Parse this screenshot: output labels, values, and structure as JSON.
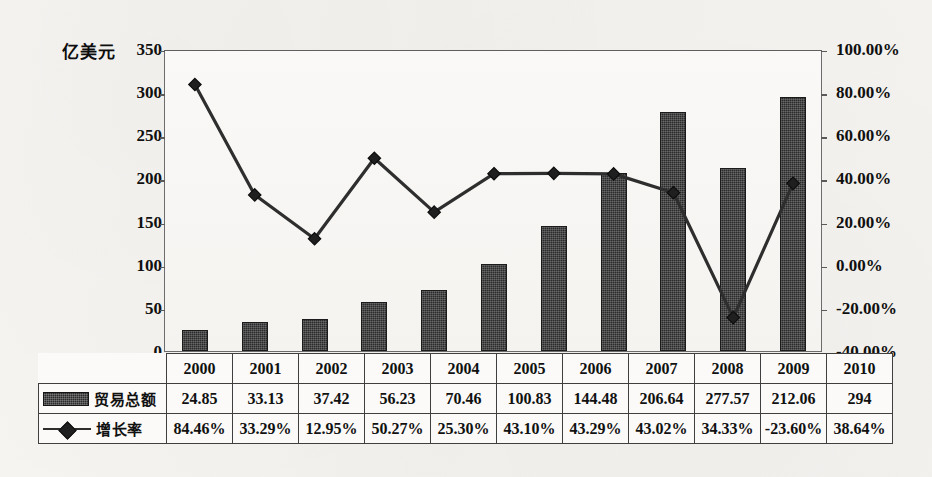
{
  "chart_data": {
    "type": "bar",
    "title": "",
    "subtitle": "",
    "xlabel": "",
    "ylabel": "亿美元",
    "y2label": "",
    "grid": false,
    "legend_position": "table-left",
    "categories": [
      "2000",
      "2001",
      "2002",
      "2003",
      "2004",
      "2005",
      "2006",
      "2007",
      "2008",
      "2009",
      "2010"
    ],
    "ylim": [
      0,
      350
    ],
    "yticks": [
      "0",
      "50",
      "100",
      "150",
      "200",
      "250",
      "300",
      "350"
    ],
    "y2lim": [
      -40,
      100
    ],
    "y2ticks": [
      "-40.00%",
      "-20.00%",
      "0.00%",
      "20.00%",
      "40.00%",
      "60.00%",
      "80.00%",
      "100.00%"
    ],
    "series": [
      {
        "name": "贸易总额",
        "kind": "bar",
        "axis": "left",
        "color": "#2b2b2b",
        "values": [
          24.85,
          33.13,
          37.42,
          56.23,
          70.46,
          100.83,
          144.48,
          206.64,
          277.57,
          212.06,
          294
        ],
        "labels": [
          "24.85",
          "33.13",
          "37.42",
          "56.23",
          "70.46",
          "100.83",
          "144.48",
          "206.64",
          "277.57",
          "212.06",
          "294"
        ]
      },
      {
        "name": "增长率",
        "kind": "line",
        "axis": "right",
        "color": "#2e2e2e",
        "marker": "diamond",
        "values": [
          84.46,
          33.29,
          12.95,
          50.27,
          25.3,
          43.1,
          43.29,
          43.02,
          34.33,
          -23.6,
          38.64
        ],
        "labels": [
          "84.46%",
          "33.29%",
          "12.95%",
          "50.27%",
          "25.30%",
          "43.10%",
          "43.29%",
          "43.02%",
          "34.33%",
          "-23.60%",
          "38.64%"
        ]
      }
    ]
  },
  "table": {
    "row_labels": [
      "贸易总额",
      "增长率"
    ],
    "legend_icons": [
      "bar-swatch-icon",
      "line-diamond-swatch-icon"
    ],
    "header": [
      "2000",
      "2001",
      "2002",
      "2003",
      "2004",
      "2005",
      "2006",
      "2007",
      "2008",
      "2009",
      "2010"
    ],
    "rows": [
      [
        "24.85",
        "33.13",
        "37.42",
        "56.23",
        "70.46",
        "100.83",
        "144.48",
        "206.64",
        "277.57",
        "212.06",
        "294"
      ],
      [
        "84.46%",
        "33.29%",
        "12.95%",
        "50.27%",
        "25.30%",
        "43.10%",
        "43.29%",
        "43.02%",
        "34.33%",
        "-23.60%",
        "38.64%"
      ]
    ]
  },
  "colors": {
    "bar": "#2b2b2b",
    "line": "#2e2e2e",
    "frame": "#6c6c6c",
    "text": "#111111",
    "page_bg": "#f3f2ef"
  }
}
